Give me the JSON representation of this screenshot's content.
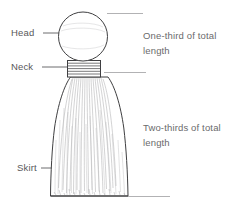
{
  "figure": {
    "background_color": "#ffffff",
    "ink_color": "#3a3a3c",
    "text_color": "#58585a",
    "annotation_text_color": "#6a6a6c"
  },
  "part_labels": [
    {
      "id": "head",
      "text": "Head"
    },
    {
      "id": "neck",
      "text": "Neck"
    },
    {
      "id": "skirt",
      "text": "Skirt"
    }
  ],
  "annotations": [
    {
      "id": "upper",
      "line1": "One-third of total",
      "line2": "length"
    },
    {
      "id": "lower",
      "line1": "Two-thirds of total",
      "line2": "length"
    }
  ],
  "icons": {
    "head": "circle-head-icon",
    "neck": "banded-neck-icon",
    "skirt": "flared-skirt-icon",
    "leader": "leader-line-icon",
    "dimension": "dimension-rule-icon"
  }
}
